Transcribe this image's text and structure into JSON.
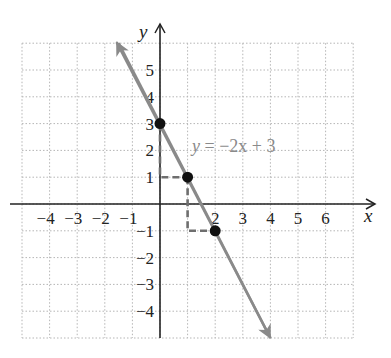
{
  "chart_data": {
    "type": "line",
    "title": "",
    "xlabel": "x",
    "ylabel": "y",
    "xlim": [
      -5,
      7
    ],
    "ylim": [
      -5,
      6
    ],
    "grid": true,
    "grid_style": "dotted",
    "x_ticks": [
      "−4",
      "−3",
      "−2",
      "−1",
      "2",
      "3",
      "4",
      "5",
      "6"
    ],
    "x_tick_values": [
      -4,
      -3,
      -2,
      -1,
      2,
      3,
      4,
      5,
      6
    ],
    "y_ticks": [
      "5",
      "4",
      "3",
      "2",
      "1",
      "−1",
      "−2",
      "−3",
      "−4"
    ],
    "y_tick_values": [
      5,
      4,
      3,
      2,
      1,
      -1,
      -2,
      -3,
      -4
    ],
    "series": [
      {
        "name": "y = −2x + 3",
        "slope": -2,
        "intercept": 3,
        "line_color": "#8a8a8a",
        "arrow_start": {
          "x": -1.5,
          "y": 6
        },
        "arrow_end": {
          "x": 4,
          "y": -5
        },
        "points": [
          {
            "x": 0,
            "y": 3
          },
          {
            "x": 1,
            "y": 1
          },
          {
            "x": 2,
            "y": -1
          }
        ]
      }
    ],
    "annotations": [
      {
        "text": "y = −2x + 3",
        "x": 1.1,
        "y": 2.2
      },
      {
        "type": "slope-triangle",
        "from": {
          "x": 0,
          "y": 3
        },
        "to": {
          "x": 1,
          "y": 1
        },
        "style": "dashed"
      },
      {
        "type": "slope-triangle",
        "from": {
          "x": 1,
          "y": 1
        },
        "to": {
          "x": 2,
          "y": -1
        },
        "style": "dashed"
      }
    ]
  },
  "labels": {
    "x_axis": "x",
    "y_axis": "y",
    "equation_prefix": "y",
    "equation_body": " = −2x + 3"
  }
}
